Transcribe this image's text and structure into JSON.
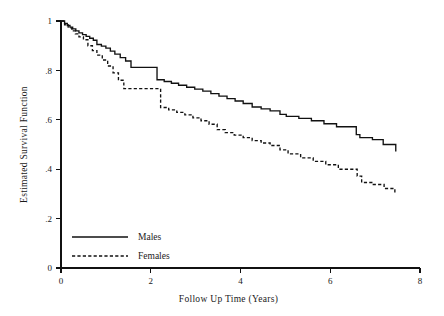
{
  "chart_data": {
    "type": "line",
    "title": "",
    "xlabel": "Follow Up Time (Years)",
    "ylabel": "Estimated Survival Function",
    "xlim": [
      0,
      8
    ],
    "ylim": [
      0,
      1
    ],
    "xticks": [
      0,
      2,
      4,
      6,
      8
    ],
    "xtick_labels": [
      "0",
      "2",
      "4",
      "6",
      "8"
    ],
    "yticks": [
      0,
      0.2,
      0.4,
      0.6,
      0.8,
      1
    ],
    "ytick_labels": [
      "0",
      ".2",
      ".4",
      ".6",
      ".8",
      "1"
    ],
    "grid": false,
    "legend_position": "bottom-left",
    "series": [
      {
        "name": "Males",
        "style": "solid",
        "color": "#111111",
        "step": "post",
        "x": [
          0.0,
          0.08,
          0.14,
          0.2,
          0.26,
          0.33,
          0.4,
          0.48,
          0.56,
          0.64,
          0.72,
          0.8,
          0.9,
          1.0,
          1.1,
          1.2,
          1.32,
          1.44,
          1.56,
          2.06,
          2.14,
          2.3,
          2.46,
          2.62,
          2.8,
          2.98,
          3.16,
          3.34,
          3.52,
          3.7,
          3.88,
          4.06,
          4.26,
          4.46,
          4.66,
          4.88,
          5.02,
          5.3,
          5.58,
          5.86,
          6.14,
          6.58,
          6.66,
          6.94,
          7.18,
          7.46
        ],
        "y": [
          1.0,
          0.99,
          0.982,
          0.975,
          0.968,
          0.96,
          0.952,
          0.945,
          0.938,
          0.93,
          0.922,
          0.905,
          0.898,
          0.89,
          0.878,
          0.866,
          0.852,
          0.838,
          0.812,
          0.812,
          0.762,
          0.755,
          0.748,
          0.74,
          0.732,
          0.724,
          0.716,
          0.706,
          0.696,
          0.686,
          0.676,
          0.666,
          0.652,
          0.644,
          0.636,
          0.622,
          0.614,
          0.606,
          0.596,
          0.584,
          0.572,
          0.54,
          0.528,
          0.52,
          0.5,
          0.472
        ]
      },
      {
        "name": "Females",
        "style": "dashed",
        "color": "#111111",
        "step": "post",
        "x": [
          0.0,
          0.08,
          0.16,
          0.24,
          0.32,
          0.4,
          0.5,
          0.6,
          0.7,
          0.8,
          0.92,
          1.04,
          1.16,
          1.28,
          1.4,
          2.08,
          2.22,
          2.4,
          2.58,
          2.76,
          2.94,
          3.12,
          3.3,
          3.48,
          3.66,
          3.86,
          4.06,
          4.26,
          4.46,
          4.66,
          4.88,
          5.06,
          5.34,
          5.62,
          5.9,
          6.18,
          6.6,
          6.7,
          6.96,
          7.2,
          7.44
        ],
        "y": [
          1.0,
          0.985,
          0.972,
          0.96,
          0.948,
          0.936,
          0.924,
          0.9,
          0.88,
          0.862,
          0.842,
          0.818,
          0.79,
          0.76,
          0.726,
          0.726,
          0.65,
          0.64,
          0.63,
          0.62,
          0.608,
          0.596,
          0.582,
          0.56,
          0.548,
          0.538,
          0.528,
          0.516,
          0.506,
          0.496,
          0.478,
          0.462,
          0.446,
          0.432,
          0.418,
          0.4,
          0.372,
          0.346,
          0.338,
          0.322,
          0.302
        ]
      }
    ]
  },
  "legend": {
    "entries": [
      {
        "label": "Males",
        "style": "solid"
      },
      {
        "label": "Females",
        "style": "dashed"
      }
    ]
  }
}
